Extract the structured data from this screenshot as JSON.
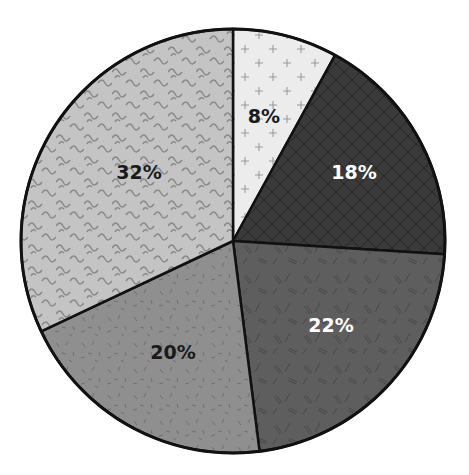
{
  "chart_data": {
    "type": "pie",
    "title": "",
    "start_angle_deg": 0,
    "direction": "clockwise",
    "slices": [
      {
        "label": "8%",
        "value": 8,
        "fill": "#ececec",
        "pattern": "plus",
        "pattern_color": "#9a9a9a",
        "text_color": "#1a1a1a"
      },
      {
        "label": "18%",
        "value": 18,
        "fill": "#3a3a3a",
        "pattern": "crosshatch",
        "pattern_color": "#262626",
        "text_color": "#ffffff"
      },
      {
        "label": "22%",
        "value": 22,
        "fill": "#5e5e5e",
        "pattern": "dashes",
        "pattern_color": "#474747",
        "text_color": "#ffffff"
      },
      {
        "label": "20%",
        "value": 20,
        "fill": "#8f8f8f",
        "pattern": "specks",
        "pattern_color": "#6e6e6e",
        "text_color": "#1a1a1a"
      },
      {
        "label": "32%",
        "value": 32,
        "fill": "#c4c4c4",
        "pattern": "waves",
        "pattern_color": "#8a8a8a",
        "text_color": "#1a1a1a"
      }
    ],
    "legend": null,
    "outline_color": "#111111"
  }
}
